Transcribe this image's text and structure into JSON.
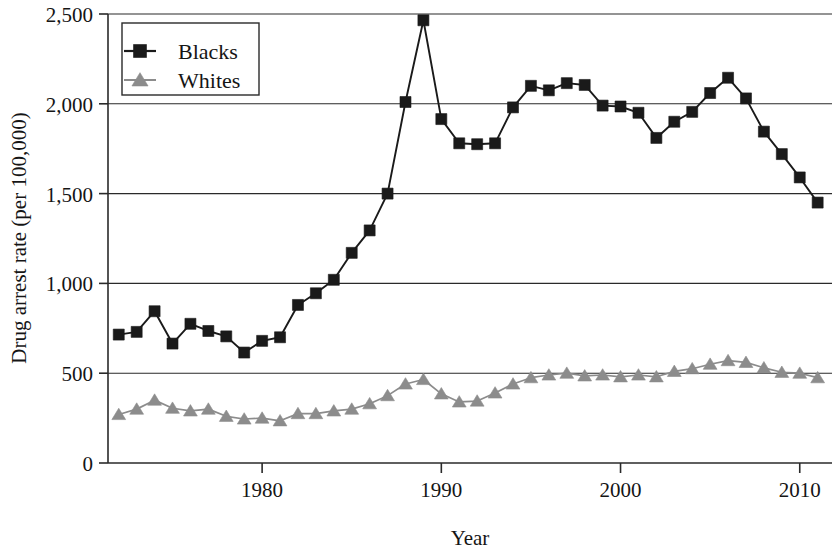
{
  "chart_data": {
    "type": "line",
    "title": "",
    "xlabel": "Year",
    "ylabel": "Drug arrest rate (per 100,000)",
    "xlim": [
      1971.4,
      2011.8
    ],
    "ylim": [
      0,
      2500
    ],
    "xticks": [
      1980,
      1990,
      2000,
      2010
    ],
    "xtick_labels": [
      "1980",
      "1990",
      "2000",
      "2010"
    ],
    "yticks": [
      0,
      500,
      1000,
      1500,
      2000,
      2500
    ],
    "ytick_labels": [
      "0",
      "500",
      "1,000",
      "1,500",
      "2,000",
      "2,500"
    ],
    "grid": "horizontal",
    "legend_position": "upper-left-inside",
    "x": [
      1972,
      1973,
      1974,
      1975,
      1976,
      1977,
      1978,
      1979,
      1980,
      1981,
      1982,
      1983,
      1984,
      1985,
      1986,
      1987,
      1988,
      1989,
      1990,
      1991,
      1992,
      1993,
      1994,
      1995,
      1996,
      1997,
      1998,
      1999,
      2000,
      2001,
      2002,
      2003,
      2004,
      2005,
      2006,
      2007,
      2008,
      2009,
      2010,
      2011
    ],
    "series": [
      {
        "name": "Blacks",
        "color": "#1a1a1a",
        "marker": "square",
        "values": [
          715,
          730,
          845,
          665,
          775,
          735,
          705,
          615,
          680,
          700,
          880,
          945,
          1020,
          1170,
          1295,
          1500,
          2010,
          2465,
          1915,
          1780,
          1775,
          1780,
          1980,
          2100,
          2075,
          2115,
          2105,
          1990,
          1985,
          1950,
          1810,
          1900,
          1955,
          2060,
          2145,
          2030,
          1845,
          1720,
          1590,
          1450
        ]
      },
      {
        "name": "Whites",
        "color": "#8c8c8c",
        "marker": "triangle",
        "values": [
          270,
          300,
          350,
          305,
          290,
          300,
          260,
          245,
          250,
          235,
          275,
          275,
          290,
          300,
          330,
          375,
          440,
          465,
          385,
          340,
          345,
          390,
          440,
          475,
          490,
          500,
          485,
          490,
          480,
          490,
          480,
          510,
          525,
          550,
          570,
          560,
          530,
          505,
          500,
          475
        ]
      }
    ]
  },
  "legend": {
    "entries": [
      {
        "label": "Blacks"
      },
      {
        "label": "Whites"
      }
    ]
  }
}
